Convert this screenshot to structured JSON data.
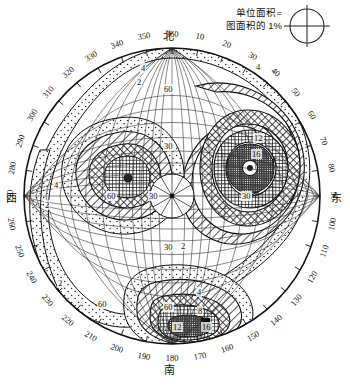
{
  "legend": {
    "line1": "单位面积=",
    "line2": "图面积的 1%",
    "symbol": "unit-area-circle"
  },
  "cardinals": [
    {
      "label": "北",
      "azimuth": 360,
      "position": "top"
    },
    {
      "label": "东",
      "azimuth": 90,
      "position": "right"
    },
    {
      "label": "南",
      "azimuth": 180,
      "position": "bottom"
    },
    {
      "label": "西",
      "azimuth": 270,
      "position": "left"
    }
  ],
  "azimuth_ticks": [
    "360",
    "10",
    "20",
    "30",
    "40",
    "50",
    "60",
    "70",
    "80",
    "90",
    "100",
    "110",
    "120",
    "130",
    "140",
    "150",
    "160",
    "170",
    "180",
    "190",
    "200",
    "210",
    "220",
    "230",
    "240",
    "250",
    "260",
    "270",
    "280",
    "290",
    "300",
    "310",
    "320",
    "330",
    "340",
    "350"
  ],
  "radial_ticks": [
    "30",
    "60"
  ],
  "contour_labels": [
    "2",
    "4",
    "8",
    "12",
    "16"
  ],
  "colors": {
    "line": "#1a1a1a",
    "background": "#ffffff",
    "fill_light": "#d8d8d8",
    "fill_mid": "#9a9a9a",
    "fill_dark": "#4a4a4a"
  },
  "chart_data": {
    "type": "contour-stereonet",
    "title": "",
    "projection": "equal-area lower hemisphere (Schmidt net)",
    "unit": "点数占图面积 1% 单位面积的百分含量",
    "azimuth_range": [
      0,
      360
    ],
    "azimuth_step": 10,
    "dip_rings": [
      30,
      60,
      90
    ],
    "contour_levels": [
      2,
      4,
      8,
      12,
      16
    ],
    "legend_note": "单位面积=图面积的 1%",
    "maxima": [
      {
        "name": "NE maximum",
        "azimuth": 55,
        "dip": 40,
        "peak_level": 16,
        "labels_shown": [
          "4",
          "12",
          "16"
        ]
      },
      {
        "name": "SSE maximum",
        "azimuth": 170,
        "dip": 72,
        "peak_level": 16,
        "labels_shown": [
          "4",
          "8",
          "12",
          "16"
        ]
      },
      {
        "name": "WNW maximum",
        "azimuth": 305,
        "dip": 32,
        "peak_level": 8,
        "labels_shown": [
          "2",
          "4"
        ]
      }
    ],
    "girdle_note": "低密度 2% 带沿外缘环绕, 4% 带呈 S 形贯穿图面",
    "grid": true,
    "legend_position": "top-right"
  }
}
